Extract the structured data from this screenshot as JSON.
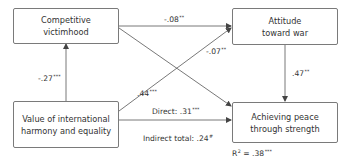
{
  "diagram": {
    "type": "path-model",
    "nodes": [
      {
        "id": "cv",
        "line1": "Competitive",
        "line2": "victimhood"
      },
      {
        "id": "atw",
        "line1": "Attitude",
        "line2": "toward war"
      },
      {
        "id": "vih",
        "line1": "Value of international",
        "line2": "harmony and equality"
      },
      {
        "id": "aps",
        "line1": "Achieving peace",
        "line2": "through strength"
      }
    ],
    "paths": [
      {
        "from": "cv",
        "to": "atw",
        "coef": "-.08",
        "sig": "**"
      },
      {
        "from": "vih",
        "to": "cv",
        "coef": "-.27",
        "sig": "***"
      },
      {
        "from": "cv",
        "to": "aps",
        "coef": "-.07",
        "sig": "**"
      },
      {
        "from": "vih",
        "to": "atw",
        "coef": ".44",
        "sig": "***"
      },
      {
        "from": "atw",
        "to": "aps",
        "coef": ".47",
        "sig": "**"
      },
      {
        "from": "vih",
        "to": "aps",
        "prefix": "Direct: ",
        "coef": ".31",
        "sig": "***"
      }
    ],
    "indirect": {
      "prefix": "Indirect total: ",
      "coef": ".24",
      "sig": "#"
    },
    "r_squared": {
      "prefix": "R",
      "exp": "2",
      "eq": " = .38",
      "sig": "***"
    }
  }
}
